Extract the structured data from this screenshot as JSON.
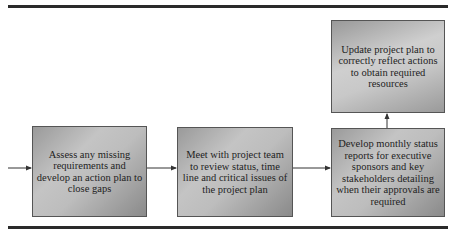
{
  "diagram": {
    "type": "flowchart",
    "nodes": [
      {
        "id": "assess",
        "label": "Assess any missing requirements and develop an action plan to close gaps"
      },
      {
        "id": "meet",
        "label": "Meet with project team to review status, time line and critical issues of the project plan"
      },
      {
        "id": "report",
        "label": "Develop monthly status reports for executive sponsors and key stakeholders detailing when their approvals are required"
      },
      {
        "id": "update",
        "label": "Update project plan to correctly reflect actions to obtain required resources"
      }
    ],
    "edges": [
      {
        "from": "(incoming)",
        "to": "assess"
      },
      {
        "from": "assess",
        "to": "meet"
      },
      {
        "from": "meet",
        "to": "report"
      },
      {
        "from": "report",
        "to": "update"
      }
    ],
    "colors": {
      "rule": "#2a2a2a",
      "box_border": "#555555",
      "box_fill_light": "#c8c8c8",
      "box_fill_dark": "#8a8a8a",
      "text": "#1e1e1e"
    }
  }
}
